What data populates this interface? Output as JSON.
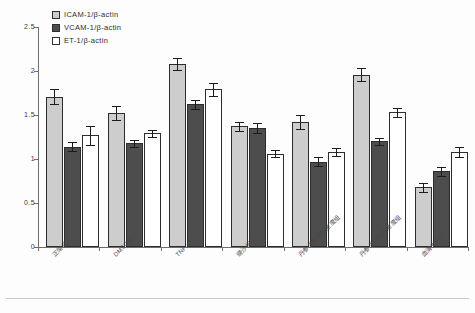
{
  "chart_data": {
    "type": "bar",
    "title": "",
    "xlabel": "",
    "ylabel": "",
    "ylim": [
      0,
      2.5
    ],
    "yticks": [
      "0",
      "0.5",
      "1",
      "1.5",
      "2",
      "2.5"
    ],
    "grid": false,
    "legend_position": "top-left",
    "categories": [
      "正常组",
      "DMSO组",
      "TNF-α组",
      "缬沙坦组",
      "丹参总酚酸低浓度组",
      "丹参总酚酸高浓度组",
      "血清对照组"
    ],
    "series": [
      {
        "name": "ICAM-1/β-actin",
        "color": "#cdcdcd",
        "values": [
          1.71,
          1.52,
          2.08,
          1.37,
          1.42,
          1.96,
          0.68
        ],
        "errors": [
          0.08,
          0.08,
          0.07,
          0.05,
          0.08,
          0.07,
          0.05
        ]
      },
      {
        "name": "VCAM-1/β-actin",
        "color": "#4d4d4d",
        "values": [
          1.14,
          1.18,
          1.62,
          1.35,
          0.97,
          1.2,
          0.86
        ],
        "errors": [
          0.05,
          0.04,
          0.05,
          0.06,
          0.05,
          0.04,
          0.05
        ]
      },
      {
        "name": "ET-1/β-actin",
        "color": "#ffffff",
        "values": [
          1.27,
          1.29,
          1.79,
          1.06,
          1.08,
          1.53,
          1.08
        ],
        "errors": [
          0.11,
          0.04,
          0.07,
          0.04,
          0.05,
          0.05,
          0.06
        ]
      }
    ]
  },
  "legend": {
    "items": [
      {
        "label": "ICAM-1/β-actin"
      },
      {
        "label": "VCAM-1/β-actin"
      },
      {
        "label": "ET-1/β-actin"
      }
    ]
  }
}
